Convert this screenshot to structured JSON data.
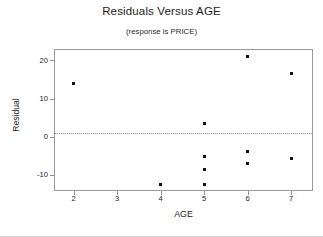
{
  "chart_data": {
    "type": "scatter",
    "title": "Residuals Versus AGE",
    "subtitle": "(response is PRICE)",
    "xlabel": "AGE",
    "ylabel": "Residual",
    "xlim": [
      1.55,
      7.5
    ],
    "ylim": [
      -14.2,
      23.0
    ],
    "xticks": [
      2,
      3,
      4,
      5,
      6,
      7
    ],
    "xtick_labels": [
      "2",
      "3",
      "4",
      "5",
      "6",
      "7"
    ],
    "yticks": [
      20,
      10,
      0,
      -10
    ],
    "ytick_labels": [
      "20",
      "10",
      "0",
      "-10"
    ],
    "grid": false,
    "legend": "none",
    "reference_line": {
      "y": 0,
      "style": "dotted",
      "color": "#8d8d8d"
    },
    "marker": {
      "shape": "square",
      "size": 3,
      "color": "#111111"
    },
    "points": [
      {
        "x": 2,
        "y": 14.0
      },
      {
        "x": 4,
        "y": -12.6
      },
      {
        "x": 5,
        "y": 3.6
      },
      {
        "x": 5,
        "y": -5.1
      },
      {
        "x": 5,
        "y": -8.6
      },
      {
        "x": 5,
        "y": -12.4
      },
      {
        "x": 6,
        "y": 21.0
      },
      {
        "x": 6,
        "y": -3.9
      },
      {
        "x": 6,
        "y": -7.0
      },
      {
        "x": 7,
        "y": 16.5
      },
      {
        "x": 7,
        "y": -5.8
      }
    ],
    "x": [
      2,
      4,
      5,
      5,
      5,
      5,
      6,
      6,
      6,
      7,
      7
    ],
    "values": [
      14.0,
      -12.6,
      3.6,
      -5.1,
      -8.6,
      -12.4,
      21.0,
      -3.9,
      -7.0,
      16.5,
      -5.8
    ]
  },
  "colors": {
    "marker": "#111111",
    "frame": "#9a9a9a",
    "reference_line": "#8d8d8d",
    "text": "#1c1c1c",
    "background": "#ffffff"
  }
}
